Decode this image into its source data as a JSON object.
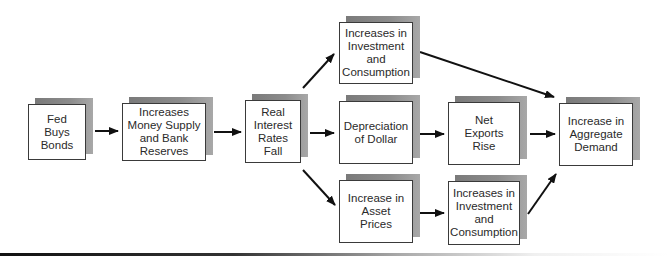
{
  "diagram": {
    "title": "",
    "nodes": [
      {
        "id": "fed",
        "label": "Fed\nBuys\nBonds",
        "x": 28,
        "y": 104,
        "w": 58,
        "h": 56
      },
      {
        "id": "money",
        "label": "Increases\nMoney Supply\nand Bank\nReserves",
        "x": 122,
        "y": 103,
        "w": 84,
        "h": 58
      },
      {
        "id": "rates",
        "label": "Real\nInterest\nRates\nFall",
        "x": 245,
        "y": 100,
        "w": 56,
        "h": 63
      },
      {
        "id": "invest_top",
        "label": "Increases in\nInvestment\nand\nConsumption",
        "x": 339,
        "y": 22,
        "w": 74,
        "h": 62
      },
      {
        "id": "dollar",
        "label": "Depreciation\nof Dollar",
        "x": 339,
        "y": 101,
        "w": 74,
        "h": 63
      },
      {
        "id": "asset",
        "label": "Increase in\nAsset\nPrices",
        "x": 339,
        "y": 180,
        "w": 74,
        "h": 63
      },
      {
        "id": "netexports",
        "label": "Net\nExports\nRise",
        "x": 448,
        "y": 102,
        "w": 72,
        "h": 63
      },
      {
        "id": "invest_bottom",
        "label": "Increases in\nInvestment\nand\nConsumption",
        "x": 448,
        "y": 181,
        "w": 72,
        "h": 64
      },
      {
        "id": "aggregate",
        "label": "Increase in\nAggregate\nDemand",
        "x": 559,
        "y": 103,
        "w": 74,
        "h": 63
      }
    ],
    "edges": [
      {
        "from": "fed",
        "to": "money"
      },
      {
        "from": "money",
        "to": "rates"
      },
      {
        "from": "rates",
        "to": "invest_top"
      },
      {
        "from": "rates",
        "to": "dollar"
      },
      {
        "from": "rates",
        "to": "asset"
      },
      {
        "from": "dollar",
        "to": "netexports"
      },
      {
        "from": "asset",
        "to": "invest_bottom"
      },
      {
        "from": "invest_top",
        "to": "aggregate"
      },
      {
        "from": "netexports",
        "to": "aggregate"
      },
      {
        "from": "invest_bottom",
        "to": "aggregate"
      }
    ],
    "colors": {
      "shadow": "#8a8a8a",
      "border": "#3a3a3a",
      "arrow": "#111111",
      "text": "#2a2a2a"
    }
  }
}
